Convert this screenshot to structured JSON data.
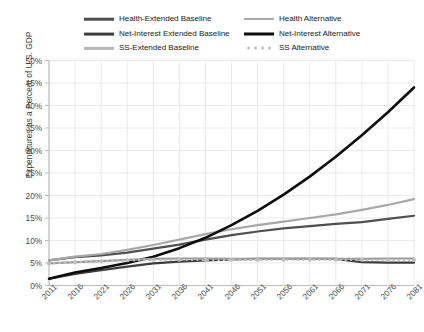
{
  "chart_data": {
    "type": "line",
    "title": "",
    "xlabel": "",
    "ylabel": "Expenditures as a Percent of U.S. GDP",
    "categories": [
      2011,
      2016,
      2021,
      2026,
      2031,
      2036,
      2041,
      2046,
      2051,
      2056,
      2061,
      2066,
      2071,
      2076,
      2081
    ],
    "x": [
      2011,
      2016,
      2021,
      2026,
      2031,
      2036,
      2041,
      2046,
      2051,
      2056,
      2061,
      2066,
      2071,
      2076,
      2081
    ],
    "xlim": [
      2011,
      2081
    ],
    "ylim": [
      0,
      50
    ],
    "ytick_labels": [
      "0%",
      "5%",
      "10%",
      "15%",
      "20%",
      "25%",
      "30%",
      "35%",
      "40%",
      "45%",
      "50%"
    ],
    "ytick_values": [
      0,
      5,
      10,
      15,
      20,
      25,
      30,
      35,
      40,
      45,
      50
    ],
    "xtick_labels": [
      "2011",
      "2016",
      "2021",
      "2026",
      "2031",
      "2036",
      "2041",
      "2046",
      "2051",
      "2056",
      "2061",
      "2066",
      "2071",
      "2076",
      "2081"
    ],
    "grid": true,
    "legend_position": "top",
    "series": [
      {
        "name": "Health-Extended Baseline",
        "color": "#4f4f4f",
        "style": "solid",
        "width": 2.2,
        "values": [
          5.6,
          6.3,
          6.7,
          7.3,
          8.2,
          9.1,
          10.2,
          11.2,
          12.0,
          12.7,
          13.2,
          13.7,
          14.1,
          14.8,
          15.5
        ],
        "order": 1
      },
      {
        "name": "Health Alternative",
        "color": "#a8a8a8",
        "style": "solid",
        "width": 2.2,
        "values": [
          5.6,
          6.4,
          7.0,
          7.9,
          9.0,
          10.2,
          11.4,
          12.5,
          13.4,
          14.2,
          15.0,
          15.8,
          16.8,
          17.9,
          19.2
        ],
        "order": 2
      },
      {
        "name": "Net-Interest Extended Baseline",
        "color": "#3d3d3d",
        "style": "solid",
        "width": 2.2,
        "values": [
          1.5,
          2.6,
          3.4,
          4.2,
          4.9,
          5.3,
          5.6,
          5.8,
          5.9,
          5.9,
          5.9,
          5.9,
          5.2,
          5.1,
          5.1
        ],
        "order": 3
      },
      {
        "name": "Net-Interest Alternative",
        "color": "#0d0d0d",
        "style": "solid",
        "width": 2.6,
        "values": [
          1.5,
          2.9,
          3.9,
          5.0,
          6.4,
          8.3,
          10.6,
          13.4,
          16.6,
          20.2,
          24.2,
          28.6,
          33.4,
          38.5,
          44.0
        ],
        "order": 4
      },
      {
        "name": "SS-Extended Baseline",
        "color": "#9a9a9a",
        "style": "solid",
        "width": 2.2,
        "values": [
          4.9,
          5.2,
          5.4,
          5.7,
          5.9,
          6.0,
          6.0,
          5.9,
          5.9,
          5.9,
          5.9,
          5.9,
          5.9,
          6.0,
          6.0
        ],
        "order": 5
      },
      {
        "name": "SS Alternative",
        "color": "#bdbdbd",
        "style": "dotted",
        "width": 2.0,
        "marker": "circle",
        "values": [
          4.9,
          5.2,
          5.4,
          5.6,
          5.7,
          5.7,
          5.7,
          5.7,
          5.7,
          5.7,
          5.7,
          5.7,
          5.7,
          5.7,
          5.7
        ],
        "order": 6
      }
    ]
  },
  "legend": {
    "left_column": [
      {
        "label": "Health-Extended Baseline",
        "color": "#4f4f4f",
        "style": "solid",
        "width": 2.6
      },
      {
        "label": "Net-Interest Extended Baseline",
        "color": "#3d3d3d",
        "style": "solid",
        "width": 2.8
      },
      {
        "label": "SS-Extended Baseline",
        "color": "#b5b5b5",
        "style": "solid",
        "width": 2.2
      }
    ],
    "right_column": [
      {
        "label": "Health Alternative",
        "color": "#a8a8a8",
        "style": "solid",
        "width": 2.2
      },
      {
        "label": "Net-Interest Alternative",
        "color": "#0d0d0d",
        "style": "solid",
        "width": 3.0
      },
      {
        "label": "SS Alternative",
        "color": "#bdbdbd",
        "style": "dotted",
        "width": 2.0
      }
    ]
  },
  "colors": {
    "background": "#ffffff",
    "grid": "#e4e4e4",
    "axis": "#bcbcbc",
    "tick_text": "#4a4a4a",
    "axis_title": "#3a3a3a"
  }
}
